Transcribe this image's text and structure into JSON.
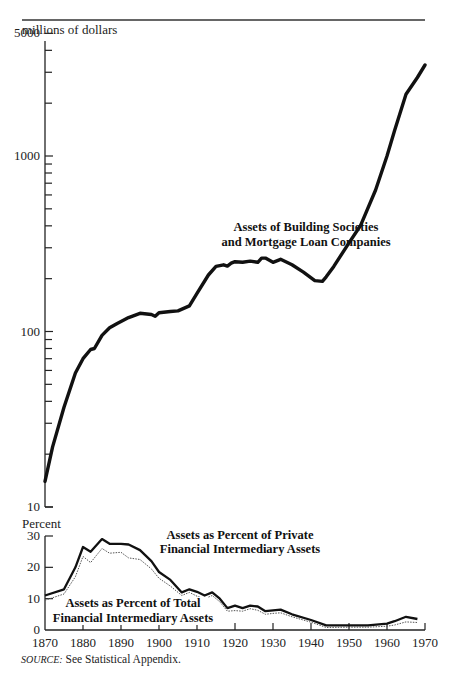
{
  "chart_data": [
    {
      "type": "line",
      "title": "Assets of Building Societies and Mortgage Loan Companies",
      "ylabel": "millions of dollars",
      "xlabel": "",
      "yscale": "log",
      "ylim": [
        10,
        5000
      ],
      "xlim": [
        1870,
        1970
      ],
      "y_ticks": [
        "10",
        "100",
        "1000",
        "5000"
      ],
      "grid": false,
      "annotation": [
        "Assets of Building Societies",
        "and Mortgage Loan Companies"
      ],
      "series": [
        {
          "name": "Assets of Building Societies and Mortgage Loan Companies",
          "style": "solid-thick",
          "x": [
            1870,
            1872,
            1875,
            1878,
            1880,
            1882,
            1883,
            1885,
            1887,
            1889,
            1890,
            1892,
            1895,
            1898,
            1899,
            1900,
            1903,
            1905,
            1908,
            1910,
            1913,
            1915,
            1917,
            1918,
            1919,
            1920,
            1922,
            1924,
            1926,
            1927,
            1928,
            1930,
            1932,
            1935,
            1938,
            1941,
            1943,
            1944,
            1946,
            1950,
            1953,
            1957,
            1960,
            1962,
            1965,
            1968,
            1970
          ],
          "values": [
            14,
            22,
            37,
            58,
            70,
            79,
            80,
            95,
            105,
            111,
            114,
            120,
            127,
            125,
            122,
            128,
            130,
            131,
            140,
            165,
            210,
            235,
            240,
            236,
            245,
            250,
            248,
            252,
            248,
            262,
            262,
            248,
            258,
            240,
            218,
            195,
            193,
            205,
            235,
            320,
            400,
            640,
            1000,
            1400,
            2250,
            2800,
            3300
          ]
        }
      ]
    },
    {
      "type": "line",
      "title": "",
      "ylabel": "Percent",
      "xlabel": "",
      "ylim": [
        0,
        30
      ],
      "xlim": [
        1870,
        1970
      ],
      "y_ticks": [
        "0",
        "10",
        "20",
        "30"
      ],
      "x_ticks": [
        "1870",
        "1880",
        "1890",
        "1900",
        "1910",
        "1920",
        "1930",
        "1940",
        "1950",
        "1960",
        "1970"
      ],
      "grid": false,
      "annotations": [
        [
          "Assets as Percent of Private",
          "Financial Intermediary Assets"
        ],
        [
          "Assets as Percent of Total",
          "Financial Intermediary Assets"
        ]
      ],
      "series": [
        {
          "name": "Assets as Percent of Private Financial Intermediary Assets",
          "style": "solid-thick",
          "x": [
            1870,
            1875,
            1878,
            1880,
            1882,
            1885,
            1887,
            1890,
            1892,
            1895,
            1898,
            1900,
            1903,
            1906,
            1908,
            1910,
            1912,
            1914,
            1916,
            1918,
            1920,
            1922,
            1924,
            1926,
            1928,
            1930,
            1932,
            1935,
            1940,
            1944,
            1950,
            1955,
            1960,
            1962,
            1965,
            1968
          ],
          "values": [
            11,
            13,
            20,
            26.5,
            25,
            29,
            27.5,
            27.5,
            27.3,
            25.5,
            22,
            18.5,
            16,
            12,
            13,
            12.2,
            11,
            12,
            10,
            7,
            7.8,
            7,
            7.8,
            7.5,
            6,
            6.3,
            6.5,
            5,
            3.2,
            1.5,
            1.5,
            1.5,
            2,
            2.8,
            4.2,
            3.5
          ]
        },
        {
          "name": "Assets as Percent of Total Financial Intermediary Assets",
          "style": "dotted-thin",
          "x": [
            1870,
            1875,
            1878,
            1880,
            1882,
            1885,
            1887,
            1890,
            1892,
            1895,
            1898,
            1900,
            1903,
            1906,
            1908,
            1910,
            1912,
            1914,
            1916,
            1918,
            1920,
            1922,
            1924,
            1926,
            1928,
            1930,
            1932,
            1935,
            1940,
            1944,
            1950,
            1955,
            1960,
            1962,
            1965,
            1968
          ],
          "values": [
            9.5,
            11.5,
            17,
            23.5,
            21.5,
            26,
            24.5,
            24.8,
            23,
            22.5,
            19.5,
            16.5,
            14,
            11,
            12,
            10.8,
            10,
            11,
            9,
            6,
            6.2,
            6,
            6.8,
            6.3,
            5,
            5.3,
            5.5,
            4.2,
            2.5,
            0.8,
            0.9,
            0.9,
            1.2,
            1.6,
            2.6,
            2.4
          ]
        }
      ]
    }
  ],
  "figure": {
    "upper": {
      "ylabel": "millions of dollars",
      "tick_labels": [
        {
          "label": "5000",
          "value": 5000
        },
        {
          "label": "1000",
          "value": 1000
        },
        {
          "label": "100",
          "value": 100
        },
        {
          "label": "10",
          "value": 10
        }
      ],
      "annotation_line1": "Assets of Building Societies",
      "annotation_line2": "and Mortgage Loan Companies"
    },
    "lower": {
      "ylabel": "Percent",
      "tick_labels": [
        "0",
        "10",
        "20",
        "30"
      ],
      "x_tick_labels": [
        "1870",
        "1880",
        "1890",
        "1900",
        "1910",
        "1920",
        "1930",
        "1940",
        "1950",
        "1960",
        "1970"
      ],
      "private_line1": "Assets as Percent of Private",
      "private_line2": "Financial Intermediary Assets",
      "total_line1": "Assets as Percent of Total",
      "total_line2": "Financial Intermediary Assets"
    },
    "source_label": "SOURCE:",
    "source_text": " See Statistical Appendix."
  },
  "colors": {
    "line": "#111111",
    "dotted": "#555555",
    "axis": "#222222",
    "rule": "#333333"
  }
}
